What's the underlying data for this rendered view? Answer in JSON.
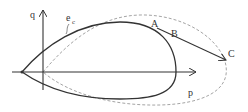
{
  "diagram": {
    "type": "yield-surface-plot",
    "axes": {
      "x_label": "p",
      "y_label": "q"
    },
    "curves": [
      {
        "name": "solid-yield-curve",
        "style": "solid",
        "label": "e_c"
      },
      {
        "name": "dashed-expanded-curve",
        "style": "dashed"
      }
    ],
    "labels": {
      "ec_main": "e",
      "ec_sub": "c",
      "point_a": "A",
      "point_b": "B",
      "point_c": "C"
    },
    "colors": {
      "line": "#333333",
      "dashed": "#9a9a9a",
      "background": "#ffffff"
    }
  }
}
